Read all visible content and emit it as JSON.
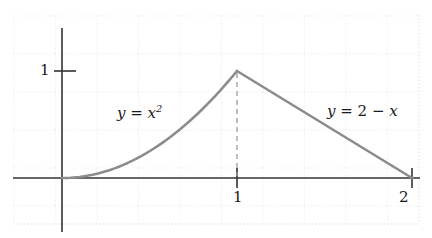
{
  "figure": {
    "width": 432,
    "height": 238,
    "background_color": "#ffffff",
    "grid_color": "#d8d8d8",
    "axis_color": "#333333",
    "curve_color": "#8c8c8c",
    "dash_color": "#9a9a9a",
    "text_color": "#1a1a1a"
  },
  "labels": {
    "curve_left_y": "y",
    "curve_left_eq": " = ",
    "curve_left_x": "x",
    "curve_left_exp": "2",
    "curve_left_full": "y = x²",
    "curve_right_full": "y = 2 − x",
    "curve_right_y": "y",
    "curve_right_eq": " = 2 − ",
    "curve_right_x": "x",
    "y_tick_1": "1",
    "x_tick_1": "1",
    "x_tick_2": "2"
  },
  "chart_data": {
    "type": "line",
    "title": "",
    "xlabel": "",
    "ylabel": "",
    "xlim": [
      -0.28,
      2.1
    ],
    "ylim": [
      -0.35,
      1.55
    ],
    "grid": true,
    "grid_style": "dotted",
    "legend": "none",
    "axis_ticks": {
      "x": [
        1,
        2
      ],
      "y": [
        1
      ]
    },
    "annotations": [
      {
        "text": "y = x²",
        "x": 0.47,
        "y": 0.66
      },
      {
        "text": "y = 2 - x",
        "x": 1.55,
        "y": 0.66
      },
      {
        "text": "dashed vertical drop line at x = 1 from y = 0 to y = 1"
      }
    ],
    "series": [
      {
        "name": "y = x^2",
        "domain": [
          0,
          1
        ],
        "x": [
          0,
          0.1,
          0.2,
          0.3,
          0.4,
          0.5,
          0.6,
          0.7,
          0.8,
          0.9,
          1.0
        ],
        "values": [
          0,
          0.01,
          0.04,
          0.09,
          0.16,
          0.25,
          0.36,
          0.49,
          0.64,
          0.81,
          1.0
        ]
      },
      {
        "name": "y = 2 - x",
        "domain": [
          1,
          2
        ],
        "x": [
          1.0,
          1.25,
          1.5,
          1.75,
          2.0
        ],
        "values": [
          1.0,
          0.75,
          0.5,
          0.25,
          0.0
        ]
      }
    ]
  }
}
